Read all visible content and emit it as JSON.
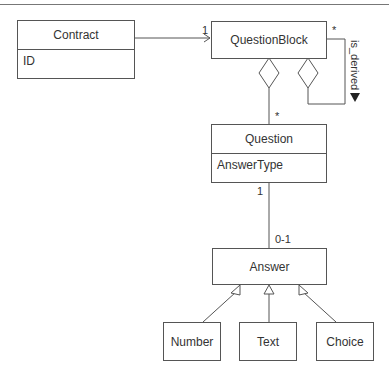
{
  "classes": {
    "contract": {
      "name": "Contract",
      "attributes": [
        "ID"
      ]
    },
    "question_block": {
      "name": "QuestionBlock"
    },
    "question": {
      "name": "Question",
      "attributes": [
        "AnswerType"
      ]
    },
    "answer": {
      "name": "Answer"
    },
    "number": {
      "name": "Number"
    },
    "text": {
      "name": "Text"
    },
    "choice": {
      "name": "Choice"
    }
  },
  "associations": {
    "contract_to_block": {
      "target_multiplicity": "1"
    },
    "block_self": {
      "multiplicity": "*",
      "label": "is_derived",
      "direction_icon": "triangle-down"
    },
    "block_to_question": {
      "target_multiplicity": "*"
    },
    "question_to_answer": {
      "source_multiplicity": "1",
      "target_multiplicity": "0-1"
    }
  },
  "colors": {
    "line": "#555555",
    "text": "#333333",
    "background": "#ffffff"
  }
}
